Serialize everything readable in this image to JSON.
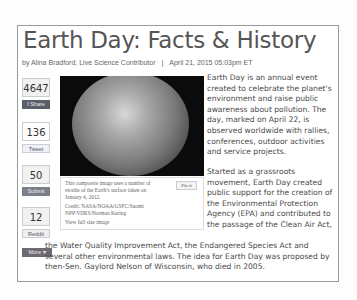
{
  "article": {
    "title": "Earth Day: Facts & History",
    "author": "by Alina Bradford, Live Science Contributor",
    "separator": "|",
    "date": "April 21, 2015 05:03pm ET"
  },
  "social": {
    "facebook": {
      "count": "4647",
      "label": "f Share",
      "icon": "facebook-icon"
    },
    "twitter": {
      "count": "136",
      "label": "Tweet",
      "icon": "twitter-icon"
    },
    "stumbleupon": {
      "count": "50",
      "label": "Submit",
      "icon": "stumbleupon-icon"
    },
    "reddit": {
      "count": "12",
      "label": "Reddit",
      "icon": "reddit-icon"
    },
    "more": {
      "label": "More ▾"
    }
  },
  "image": {
    "caption": "This composite image uses a number of swaths of the Earth's surface taken on January 4, 2012.",
    "credit": "Credit: NASA/NOAA/GSFC/Suomi NPP/VIIRS/Norman Kuring",
    "full_size_link": "View full size image",
    "pin_label": "Pin it"
  },
  "body": {
    "p1": "Earth Day is an annual event created to celebrate the planet's environment and raise public awareness about pollution. The day, marked on April 22, is observed worldwide with rallies, conferences, outdoor activities and service projects.",
    "p2": "Started as a grassroots movement, Earth Day created public support for the creation of the Environmental Protection Agency (EPA) and contributed to the passage of the Clean Air Act,",
    "p3": "the Water Quality Improvement Act, the Endangered Species Act and several other environmental laws. The idea for Earth Day was proposed by then-Sen. Gaylord Nelson of Wisconsin, who died in 2005."
  }
}
